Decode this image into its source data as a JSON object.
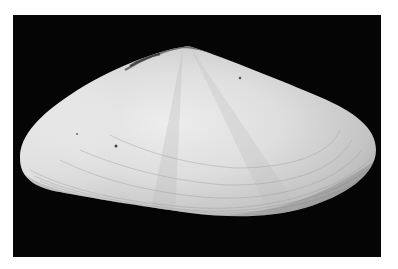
{
  "image": {
    "subject": "bivalve shell",
    "description": "Photograph of a single pale, elongated bivalve shell (clam valve) with concentric growth lines, shown on a black background with a white margin",
    "colors": {
      "background_margin": "#ffffff",
      "backdrop": "#050505",
      "shell_light": "#ececec",
      "shell_mid": "#c9c9c9",
      "shell_shadow": "#9a9a9a"
    }
  }
}
